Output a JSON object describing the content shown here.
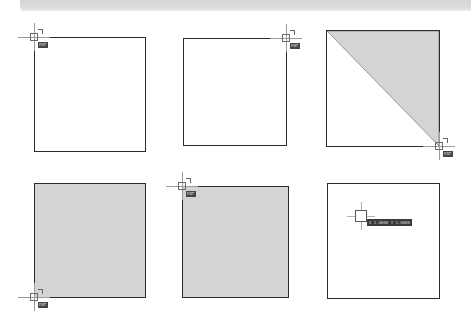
{
  "canvas": {
    "background": "#ffffff",
    "fill_color": "#d4d4d4",
    "stroke_color": "#2b2b2b"
  },
  "panels": [
    {
      "id": 1,
      "fill": "none",
      "cursor_position": "top-left",
      "cursor_tip": "ENT"
    },
    {
      "id": 2,
      "fill": "none",
      "cursor_position": "top-right",
      "cursor_tip": "ENT"
    },
    {
      "id": 3,
      "fill": "triangle-upper-right",
      "cursor_position": "bottom-right",
      "cursor_tip": "ENT"
    },
    {
      "id": 4,
      "fill": "solid",
      "cursor_position": "bottom-left",
      "cursor_tip": "ENT"
    },
    {
      "id": 5,
      "fill": "solid",
      "cursor_position": "top-left",
      "cursor_tip": "ENT"
    },
    {
      "id": 6,
      "fill": "none",
      "cursor_position": "interior",
      "cursor_tip": "X 1.0000  Y 1.0000"
    }
  ]
}
